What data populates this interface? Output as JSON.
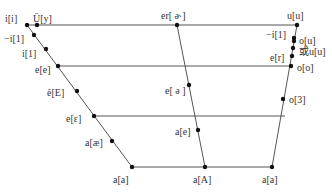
{
  "diagram": {
    "type": "vowel-trapezoid",
    "line_color": "#555555",
    "point_color": "#111111",
    "horizontal_lines": [
      {
        "y": 25,
        "x1": 27,
        "x2": 297
      },
      {
        "y": 66,
        "x1": 58,
        "x2": 291
      },
      {
        "y": 116,
        "x1": 94,
        "x2": 285
      },
      {
        "y": 167,
        "x1": 132,
        "x2": 272
      }
    ],
    "slanted_lines": [
      {
        "x1": 27,
        "y1": 25,
        "x2": 132,
        "y2": 167
      },
      {
        "x1": 177,
        "y1": 25,
        "x2": 205,
        "y2": 167
      },
      {
        "x1": 297,
        "y1": 25,
        "x2": 272,
        "y2": 167
      }
    ],
    "points": [
      {
        "id": "i-i",
        "x": 27,
        "y": 25,
        "label": "i[i]",
        "lx": 5,
        "ly": 13
      },
      {
        "id": "u-y",
        "x": 37,
        "y": 25,
        "label": "Ü[y]",
        "lx": 33,
        "ly": 13
      },
      {
        "id": "minus-i-1-left",
        "x": 34,
        "y": 35,
        "label": "−i[1]",
        "lx": 4,
        "ly": 33
      },
      {
        "id": "i-1",
        "x": 46,
        "y": 49,
        "label": "i[1]",
        "lx": 22,
        "ly": 48
      },
      {
        "id": "e-e",
        "x": 58,
        "y": 66,
        "label": "e[e]",
        "lx": 35,
        "ly": 64
      },
      {
        "id": "e-hat-E",
        "x": 77,
        "y": 91,
        "label": "ê[E]",
        "lx": 47,
        "ly": 87
      },
      {
        "id": "e-epsilon",
        "x": 94,
        "y": 116,
        "label": "e[ε]",
        "lx": 66,
        "ly": 113
      },
      {
        "id": "a-ae",
        "x": 112,
        "y": 141,
        "label": "a[æ]",
        "lx": 85,
        "ly": 137
      },
      {
        "id": "a-a-left",
        "x": 132,
        "y": 167,
        "label": "a[a]",
        "lx": 113,
        "ly": 174
      },
      {
        "id": "er",
        "x": 177,
        "y": 25,
        "label": "er[ ə˞]",
        "lx": 161,
        "ly": 10
      },
      {
        "id": "e-schwa",
        "x": 189,
        "y": 85,
        "label": "e[ ə ]",
        "lx": 165,
        "ly": 85
      },
      {
        "id": "a-e",
        "x": 198,
        "y": 130,
        "label": "a[e]",
        "lx": 175,
        "ly": 126
      },
      {
        "id": "a-A",
        "x": 205,
        "y": 167,
        "label": "a[A]",
        "lx": 193,
        "ly": 174
      },
      {
        "id": "u-u",
        "x": 297,
        "y": 25,
        "label": "u[u]",
        "lx": 287,
        "ly": 10
      },
      {
        "id": "minus-i-1-right",
        "x": 294,
        "y": 38,
        "label": "−i[1]",
        "lx": 266,
        "ly": 29
      },
      {
        "id": "o-u",
        "x": 294,
        "y": 41,
        "label": "o[u]",
        "lx": 299,
        "ly": 35
      },
      {
        "id": "huo-u-u",
        "x": 293,
        "y": 48,
        "label": "或u[u]",
        "lx": 299,
        "ly": 46
      },
      {
        "id": "e-r",
        "x": 292,
        "y": 56,
        "label": "e[r]",
        "lx": 270,
        "ly": 52
      },
      {
        "id": "o-o",
        "x": 291,
        "y": 66,
        "label": "o[o]",
        "lx": 297,
        "ly": 62
      },
      {
        "id": "o-3",
        "x": 283,
        "y": 99,
        "label": "o[3]",
        "lx": 289,
        "ly": 94
      },
      {
        "id": "a-a-right",
        "x": 272,
        "y": 167,
        "label": "a[a]",
        "lx": 262,
        "ly": 174
      }
    ]
  }
}
